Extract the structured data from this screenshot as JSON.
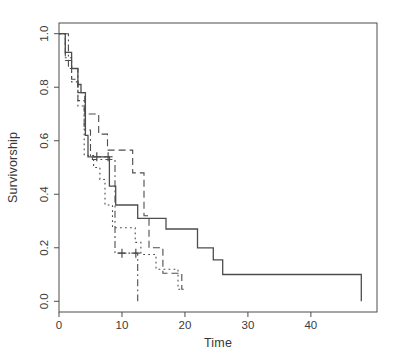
{
  "figure": {
    "background": "#ffffff",
    "line_color": "#4d4d4d",
    "text_color": "#3a3a3a"
  },
  "chart_data": {
    "type": "line",
    "subtype": "kaplan-meier-step-survival",
    "title": "",
    "xlabel": "Time",
    "ylabel": "Survivorship",
    "xlim": [
      0,
      50.5
    ],
    "ylim": [
      0,
      1.0
    ],
    "grid": false,
    "legend": "none",
    "box": true,
    "x_ticks": {
      "values": [
        0,
        10,
        20,
        30,
        40
      ],
      "labels": [
        "0",
        "10",
        "20",
        "30",
        "40"
      ]
    },
    "y_ticks": {
      "values": [
        0,
        0.2,
        0.4,
        0.6,
        0.8,
        1.0
      ],
      "labels": [
        "0.0",
        "0.2",
        "0.4",
        "0.6",
        "0.8",
        "1.0"
      ]
    },
    "series": [
      {
        "name": "group-1",
        "linetype": "solid",
        "points": [
          [
            0,
            1.0
          ],
          [
            1,
            0.93
          ],
          [
            2,
            0.87
          ],
          [
            3,
            0.81
          ],
          [
            3.5,
            0.78
          ],
          [
            4.2,
            0.62
          ],
          [
            4.6,
            0.54
          ],
          [
            8,
            0.43
          ],
          [
            9,
            0.36
          ],
          [
            12.5,
            0.31
          ],
          [
            17,
            0.27
          ],
          [
            22,
            0.2
          ],
          [
            24.5,
            0.155
          ],
          [
            26,
            0.1
          ],
          [
            48,
            0.0
          ]
        ],
        "censor_marks": [
          [
            6.0,
            0.54
          ],
          [
            7.8,
            0.54
          ]
        ],
        "end_time": null
      },
      {
        "name": "group-2",
        "linetype": "dashed",
        "points": [
          [
            0,
            1.0
          ],
          [
            1,
            0.9
          ],
          [
            2,
            0.83
          ],
          [
            3,
            0.78
          ],
          [
            4.1,
            0.7
          ],
          [
            6.3,
            0.625
          ],
          [
            7.7,
            0.565
          ],
          [
            11.7,
            0.48
          ],
          [
            13.5,
            0.32
          ],
          [
            14.3,
            0.2
          ],
          [
            16.5,
            0.105
          ],
          [
            19.5,
            0.045
          ]
        ],
        "censor_marks": [],
        "end_time": 19.8
      },
      {
        "name": "group-3",
        "linetype": "dotted",
        "points": [
          [
            0,
            1.0
          ],
          [
            1,
            0.91
          ],
          [
            2,
            0.82
          ],
          [
            3,
            0.73
          ],
          [
            4,
            0.545
          ],
          [
            5.5,
            0.5
          ],
          [
            6.5,
            0.455
          ],
          [
            7.3,
            0.36
          ],
          [
            8.5,
            0.275
          ],
          [
            12.1,
            0.22
          ],
          [
            13,
            0.175
          ],
          [
            15.4,
            0.12
          ],
          [
            18.9,
            0.045
          ]
        ],
        "censor_marks": [],
        "end_time": 19.3
      },
      {
        "name": "group-4",
        "linetype": "dotdash",
        "points": [
          [
            0,
            1.0
          ],
          [
            1.5,
            0.87
          ],
          [
            3,
            0.75
          ],
          [
            4,
            0.64
          ],
          [
            5,
            0.545
          ],
          [
            5.3,
            0.53
          ],
          [
            8.9,
            0.18
          ],
          [
            12.5,
            0.0
          ]
        ],
        "censor_marks": [
          [
            10.0,
            0.18
          ],
          [
            12.2,
            0.18
          ]
        ],
        "end_time": null
      }
    ]
  }
}
